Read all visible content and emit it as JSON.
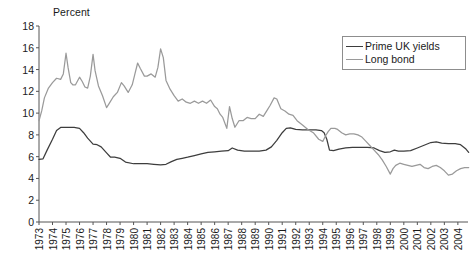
{
  "chart_data": {
    "type": "line",
    "title": "",
    "subtitle": "",
    "ylabel": "Percent",
    "xlabel": "",
    "ylim": [
      0,
      18
    ],
    "ytick_step": 2,
    "yticks": [
      "0",
      "2",
      "4",
      "6",
      "8",
      "10",
      "12",
      "14",
      "16",
      "18"
    ],
    "xlim": [
      1973,
      2004.75
    ],
    "grid": false,
    "legend_position": "top-right",
    "categories": [
      "1973",
      "1974",
      "1975",
      "1976",
      "1977",
      "1978",
      "1979",
      "1980",
      "1981",
      "1982",
      "1983",
      "1984",
      "1985",
      "1986",
      "1987",
      "1988",
      "1989",
      "1990",
      "1991",
      "1992",
      "1993",
      "1994",
      "1995",
      "1996",
      "1997",
      "1998",
      "1999",
      "2000",
      "2001",
      "2002",
      "2003",
      "2004"
    ],
    "series": [
      {
        "name": "Prime UK yields",
        "color": "#3d3d3d",
        "x": [
          1973.0,
          1973.3,
          1973.6,
          1974.0,
          1974.3,
          1974.6,
          1975.0,
          1975.3,
          1975.6,
          1976.0,
          1976.3,
          1976.6,
          1977.0,
          1977.3,
          1977.6,
          1978.0,
          1978.3,
          1978.6,
          1979.0,
          1979.4,
          1980.0,
          1980.5,
          1981.0,
          1981.5,
          1982.0,
          1982.4,
          1982.8,
          1983.2,
          1983.6,
          1984.0,
          1984.5,
          1985.0,
          1985.5,
          1986.0,
          1986.5,
          1987.0,
          1987.3,
          1987.7,
          1988.2,
          1988.8,
          1989.3,
          1989.8,
          1990.2,
          1990.6,
          1991.0,
          1991.3,
          1991.6,
          1992.0,
          1992.5,
          1993.0,
          1993.5,
          1993.9,
          1994.1,
          1994.3,
          1994.5,
          1994.8,
          1995.2,
          1995.7,
          1996.2,
          1996.8,
          1997.3,
          1997.8,
          1998.2,
          1998.6,
          1999.0,
          1999.3,
          1999.6,
          2000.0,
          2000.5,
          2001.0,
          2001.5,
          2002.0,
          2002.4,
          2002.8,
          2003.3,
          2003.8,
          2004.2,
          2004.6,
          2004.8
        ],
        "y": [
          5.75,
          5.8,
          6.6,
          7.6,
          8.4,
          8.68,
          8.7,
          8.7,
          8.7,
          8.6,
          8.2,
          7.7,
          7.15,
          7.1,
          6.9,
          6.35,
          5.95,
          5.95,
          5.85,
          5.5,
          5.35,
          5.35,
          5.35,
          5.3,
          5.25,
          5.3,
          5.55,
          5.75,
          5.85,
          5.95,
          6.1,
          6.25,
          6.4,
          6.45,
          6.5,
          6.55,
          6.8,
          6.6,
          6.5,
          6.5,
          6.5,
          6.6,
          6.9,
          7.5,
          8.2,
          8.6,
          8.65,
          8.5,
          8.45,
          8.45,
          8.45,
          8.4,
          8.2,
          7.6,
          6.6,
          6.55,
          6.7,
          6.8,
          6.85,
          6.85,
          6.85,
          6.8,
          6.55,
          6.4,
          6.45,
          6.6,
          6.5,
          6.5,
          6.55,
          6.8,
          7.05,
          7.3,
          7.35,
          7.25,
          7.2,
          7.2,
          7.1,
          6.7,
          6.4
        ]
      },
      {
        "name": "Long bond",
        "color": "#9a9a9a",
        "x": [
          1973.0,
          1973.2,
          1973.4,
          1973.7,
          1974.0,
          1974.3,
          1974.6,
          1974.8,
          1975.0,
          1975.15,
          1975.35,
          1975.5,
          1975.7,
          1976.0,
          1976.2,
          1976.4,
          1976.6,
          1976.8,
          1977.0,
          1977.15,
          1977.4,
          1977.7,
          1978.0,
          1978.2,
          1978.5,
          1978.8,
          1979.1,
          1979.3,
          1979.6,
          1979.9,
          1980.1,
          1980.3,
          1980.5,
          1980.8,
          1981.0,
          1981.3,
          1981.6,
          1981.8,
          1982.0,
          1982.2,
          1982.4,
          1982.7,
          1983.0,
          1983.3,
          1983.6,
          1983.9,
          1984.2,
          1984.5,
          1984.8,
          1985.1,
          1985.4,
          1985.7,
          1986.0,
          1986.2,
          1986.4,
          1986.6,
          1986.9,
          1987.1,
          1987.3,
          1987.5,
          1987.8,
          1988.1,
          1988.4,
          1988.7,
          1989.0,
          1989.3,
          1989.6,
          1989.9,
          1990.1,
          1990.4,
          1990.6,
          1990.9,
          1991.2,
          1991.5,
          1991.8,
          1992.1,
          1992.5,
          1992.9,
          1993.3,
          1993.7,
          1994.0,
          1994.2,
          1994.4,
          1994.6,
          1994.9,
          1995.1,
          1995.4,
          1995.7,
          1996.0,
          1996.3,
          1996.6,
          1996.9,
          1997.2,
          1997.5,
          1997.8,
          1998.1,
          1998.4,
          1998.7,
          1999.0,
          1999.2,
          1999.4,
          1999.7,
          2000.0,
          2000.3,
          2000.6,
          2000.9,
          2001.2,
          2001.5,
          2001.8,
          2002.1,
          2002.4,
          2002.7,
          2003.0,
          2003.3,
          2003.6,
          2003.9,
          2004.2,
          2004.5,
          2004.8
        ],
        "y": [
          9.3,
          10.2,
          11.4,
          12.3,
          12.8,
          13.2,
          13.1,
          13.6,
          15.5,
          14.2,
          12.8,
          12.6,
          12.6,
          13.3,
          12.9,
          12.4,
          12.3,
          13.4,
          15.4,
          13.9,
          12.5,
          11.6,
          10.5,
          10.9,
          11.5,
          11.9,
          12.8,
          12.5,
          11.9,
          12.6,
          13.6,
          14.6,
          14.1,
          13.4,
          13.4,
          13.6,
          13.3,
          14.2,
          15.9,
          15.1,
          13.0,
          12.2,
          11.6,
          11.1,
          11.3,
          11.0,
          10.9,
          11.1,
          10.9,
          11.1,
          10.9,
          11.2,
          10.6,
          10.4,
          9.9,
          9.6,
          8.6,
          10.6,
          9.5,
          8.7,
          9.3,
          9.3,
          9.6,
          9.5,
          9.5,
          9.9,
          9.7,
          10.3,
          10.7,
          11.4,
          11.3,
          10.4,
          10.2,
          9.9,
          9.8,
          9.3,
          8.9,
          8.5,
          8.2,
          7.6,
          7.4,
          7.9,
          8.3,
          8.6,
          8.6,
          8.5,
          8.2,
          8.0,
          8.1,
          8.1,
          8.0,
          7.8,
          7.4,
          7.0,
          6.6,
          6.2,
          5.7,
          5.1,
          4.4,
          4.9,
          5.2,
          5.4,
          5.3,
          5.2,
          5.1,
          5.2,
          5.3,
          5.0,
          4.9,
          5.1,
          5.2,
          5.0,
          4.7,
          4.3,
          4.4,
          4.7,
          4.9,
          5.0,
          5.0
        ]
      }
    ]
  },
  "legend": {
    "items": [
      {
        "label": "Prime UK yields",
        "color": "#3d3d3d"
      },
      {
        "label": "Long bond",
        "color": "#9a9a9a"
      }
    ]
  }
}
